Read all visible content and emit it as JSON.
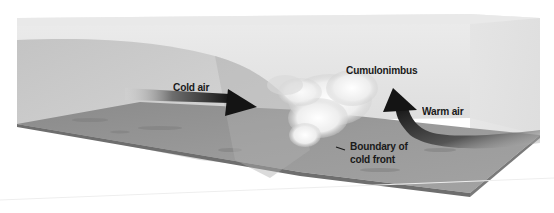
{
  "diagram": {
    "type": "cold-front-cross-section",
    "labels": {
      "cold_air": "Cold air",
      "cumulonimbus": "Cumulonimbus",
      "warm_air": "Warm air",
      "boundary_line1": "Boundary of",
      "boundary_line2": "cold front"
    },
    "elements": [
      {
        "name": "cold-air-arrow",
        "direction": "right",
        "color": "#1c1c1c"
      },
      {
        "name": "warm-air-arrow",
        "direction": "up-left curved",
        "color": "#1c1c1c"
      },
      {
        "name": "cumulonimbus-cloud",
        "color": "#f2f2f2"
      },
      {
        "name": "cold-air-mass",
        "color": "#c8c8c8"
      },
      {
        "name": "ground-plane",
        "color": "#8f8f8f"
      }
    ],
    "colors": {
      "background": "#ffffff",
      "box_face": "#e6e6e6",
      "cold_air_mass": "#c4c4c4",
      "ground": "#909090",
      "ground_front": "#7a7a7a",
      "arrow": "#1c1c1c",
      "text": "#1a1a1a"
    }
  }
}
